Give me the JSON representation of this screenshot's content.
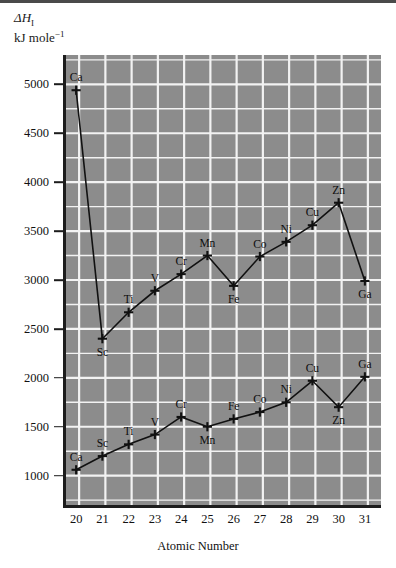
{
  "figure": {
    "y_axis_label_line1": "ΔH",
    "y_axis_label_sub": "I",
    "y_axis_label_line2": "kJ mole",
    "y_axis_label_sup": "−1",
    "x_axis_label": "Atomic Number",
    "panel_color": "#8c8c8c",
    "grid_color": "#f2f2f2",
    "axis_color": "#1c1c1c",
    "line_color": "#111111"
  },
  "chart_data": {
    "type": "line",
    "title": "",
    "xlabel": "Atomic Number",
    "ylabel": "ΔH_I / kJ mole⁻¹",
    "xlim": [
      19.5,
      31.5
    ],
    "ylim": [
      700,
      5300
    ],
    "xticks": [
      20,
      21,
      22,
      23,
      24,
      25,
      26,
      27,
      28,
      29,
      30,
      31
    ],
    "yticks": [
      1000,
      1500,
      2000,
      2500,
      3000,
      3500,
      4000,
      4500,
      5000
    ],
    "grid": true,
    "minor_grid": true,
    "minor_y_step": 250,
    "legend": "none",
    "x": [
      20,
      21,
      22,
      23,
      24,
      25,
      26,
      27,
      28,
      29,
      30,
      31
    ],
    "point_labels": [
      "Ca",
      "Sc",
      "Ti",
      "V",
      "Cr",
      "Mn",
      "Fe",
      "Co",
      "Ni",
      "Cu",
      "Zn",
      "Ga"
    ],
    "series": [
      {
        "name": "second ionisation enthalpy",
        "values": [
          4940,
          2400,
          2670,
          2890,
          3060,
          3250,
          2940,
          3240,
          3390,
          3560,
          3790,
          2990
        ],
        "label_positions": [
          "above",
          "below",
          "above",
          "above",
          "above",
          "above",
          "below",
          "above",
          "above",
          "above",
          "above",
          "below"
        ]
      },
      {
        "name": "first ionisation enthalpy",
        "values": [
          1060,
          1200,
          1320,
          1420,
          1600,
          1500,
          1580,
          1650,
          1750,
          1970,
          1700,
          2010
        ],
        "label_positions": [
          "above",
          "above",
          "above",
          "above",
          "above",
          "below",
          "above",
          "above",
          "above",
          "above",
          "below",
          "above"
        ]
      }
    ]
  }
}
